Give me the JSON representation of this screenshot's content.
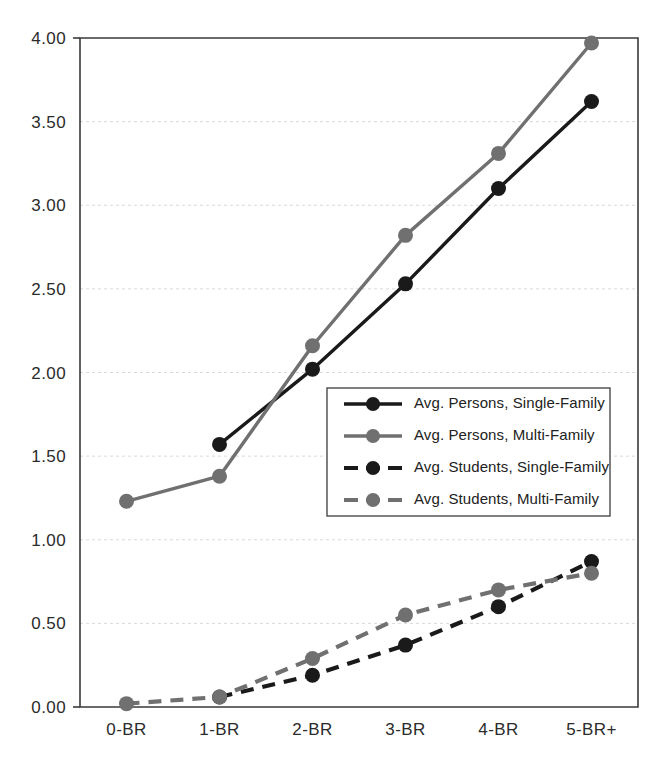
{
  "chart_data": {
    "type": "line",
    "title": "",
    "subtitle": "",
    "xlabel": "",
    "ylabel": "",
    "categories": [
      "0-BR",
      "1-BR",
      "2-BR",
      "3-BR",
      "4-BR",
      "5-BR+"
    ],
    "ylim": [
      0.0,
      4.0
    ],
    "ytick_labels": [
      "0.00",
      "0.50",
      "1.00",
      "1.50",
      "2.00",
      "2.50",
      "3.00",
      "3.50",
      "4.00"
    ],
    "ytick_values": [
      0.0,
      0.5,
      1.0,
      1.5,
      2.0,
      2.5,
      3.0,
      3.5,
      4.0
    ],
    "grid": true,
    "grid_axis": "y",
    "legend_position": "center-right-inside",
    "series": [
      {
        "name": "Avg. Persons, Single-Family",
        "values": [
          null,
          1.57,
          2.02,
          2.53,
          3.1,
          3.62
        ],
        "color": "#1a1a1a",
        "style": "solid",
        "marker": "circle"
      },
      {
        "name": "Avg. Persons, Multi-Family",
        "values": [
          1.23,
          1.38,
          2.16,
          2.82,
          3.31,
          3.97
        ],
        "color": "#707070",
        "style": "solid",
        "marker": "circle"
      },
      {
        "name": "Avg. Students, Single-Family",
        "values": [
          null,
          0.06,
          0.19,
          0.37,
          0.6,
          0.87
        ],
        "color": "#1a1a1a",
        "style": "dashed",
        "marker": "circle"
      },
      {
        "name": "Avg. Students, Multi-Family",
        "values": [
          0.02,
          0.06,
          0.29,
          0.55,
          0.7,
          0.8
        ],
        "color": "#707070",
        "style": "dashed",
        "marker": "circle"
      }
    ]
  },
  "colors": {
    "single_family": "#1a1a1a",
    "multi_family": "#707070",
    "axis": "#3a3a3a",
    "grid": "#d9d9d9",
    "background": "#ffffff"
  },
  "legend": {
    "items": [
      {
        "label": "Avg. Persons, Single-Family",
        "color": "#1a1a1a",
        "style": "solid"
      },
      {
        "label": "Avg. Persons, Multi-Family",
        "color": "#707070",
        "style": "solid"
      },
      {
        "label": "Avg. Students, Single-Family",
        "color": "#1a1a1a",
        "style": "dashed"
      },
      {
        "label": "Avg. Students, Multi-Family",
        "color": "#707070",
        "style": "dashed"
      }
    ]
  }
}
